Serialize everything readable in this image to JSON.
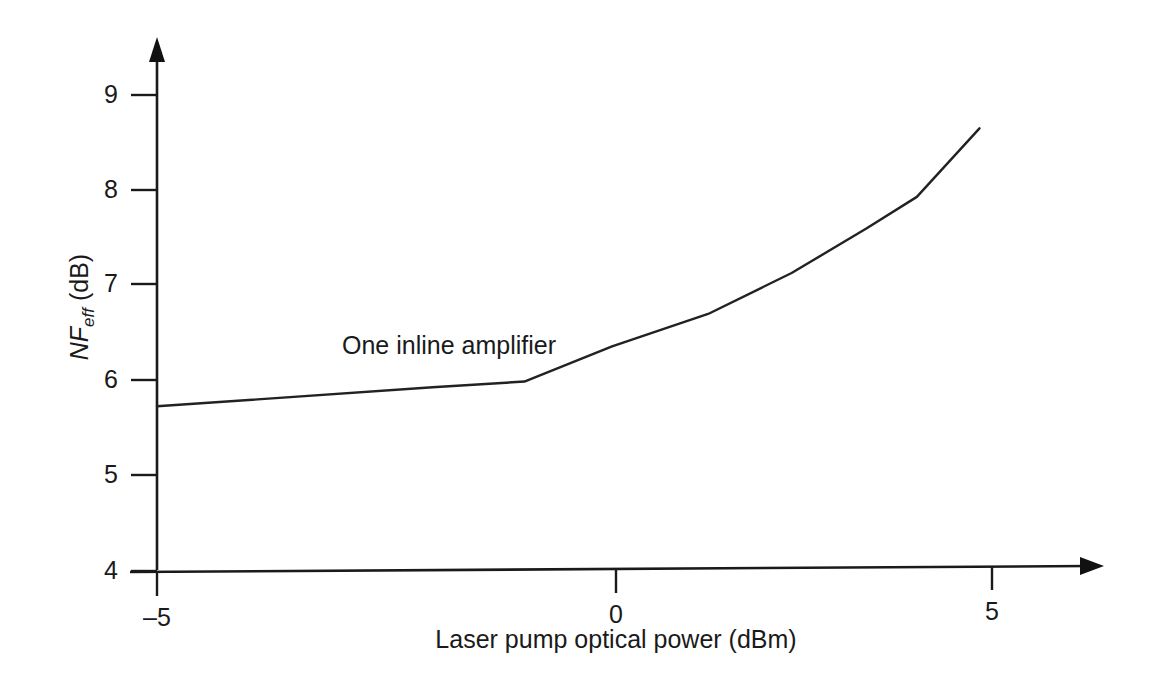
{
  "chart_data": {
    "type": "line",
    "title": "",
    "subtitle": "",
    "xlabel": "Laser pump optical power (dBm)",
    "ylabel": "NF_eff (dB)",
    "ylabel_parts": {
      "symbol": "NF",
      "subscript": "eff",
      "units": "(dB)"
    },
    "xlim": [
      -5,
      6.5
    ],
    "ylim": [
      4,
      9.45
    ],
    "xticks": [
      -5,
      0,
      5
    ],
    "xticklabels": [
      "–5",
      "0",
      "5"
    ],
    "yticks": [
      4,
      5,
      6,
      7,
      8,
      9
    ],
    "yticklabels": [
      "4",
      "5",
      "6",
      "7",
      "8",
      "9"
    ],
    "grid": false,
    "legend": "none",
    "axis_style": "arrow-tipped open axes",
    "line_color": "#222222",
    "annotations": [
      {
        "text": "One inline amplifier",
        "x": -2.8,
        "y": 6.45
      }
    ],
    "series": [
      {
        "name": "One inline amplifier",
        "x": [
          -5.0,
          -1.7,
          -0.6,
          0.45,
          1.6,
          2.6,
          3.5,
          4.1,
          4.85
        ],
        "values": [
          5.73,
          5.93,
          5.99,
          6.36,
          6.7,
          7.13,
          7.6,
          7.93,
          8.65
        ]
      }
    ]
  },
  "axis_labels": {
    "x": [
      "–5",
      "0",
      "5"
    ],
    "y": [
      "9",
      "8",
      "7",
      "6",
      "5",
      "4"
    ]
  }
}
